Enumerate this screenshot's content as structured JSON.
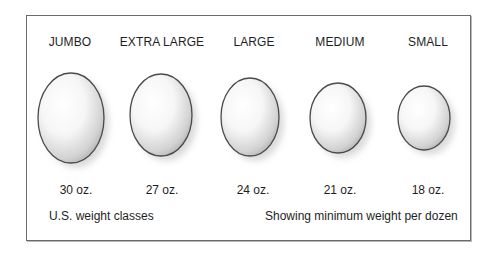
{
  "eggs": [
    {
      "size": "JUMBO",
      "weight": "30 oz.",
      "cx": 71,
      "cy": 118,
      "rx": 33,
      "ry": 45
    },
    {
      "size": "EXTRA LARGE",
      "weight": "27 oz.",
      "cx": 161,
      "cy": 115,
      "rx": 31,
      "ry": 41
    },
    {
      "size": "LARGE",
      "weight": "24 oz.",
      "cx": 250,
      "cy": 117,
      "rx": 29,
      "ry": 39
    },
    {
      "size": "MEDIUM",
      "weight": "21 oz.",
      "cx": 338,
      "cy": 118,
      "rx": 28,
      "ry": 35
    },
    {
      "size": "SMALL",
      "weight": "18 oz.",
      "cx": 424,
      "cy": 118,
      "rx": 26,
      "ry": 32
    }
  ],
  "footer": {
    "left": "U.S. weight classes",
    "right": "Showing minimum weight per dozen"
  },
  "colors": {
    "outline": "#4a4a4a",
    "shade": "#bdbdbd",
    "highlight": "#ffffff",
    "frame": "#6a6a6a"
  }
}
